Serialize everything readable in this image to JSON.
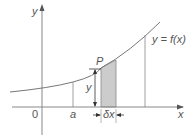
{
  "diagram": {
    "type": "area-under-curve",
    "axes": {
      "x_label": "x",
      "y_label": "y",
      "origin_label": "0"
    },
    "curve_label": "y = f(x)",
    "point_label": "P",
    "start_label": "a",
    "strip_height_label": "y",
    "strip_width_label": "δx",
    "colors": {
      "axis": "#888888",
      "curve": "#777777",
      "strip_fill": "#cccccc",
      "text": "#555555",
      "dimension_arrow": "#333333"
    }
  }
}
